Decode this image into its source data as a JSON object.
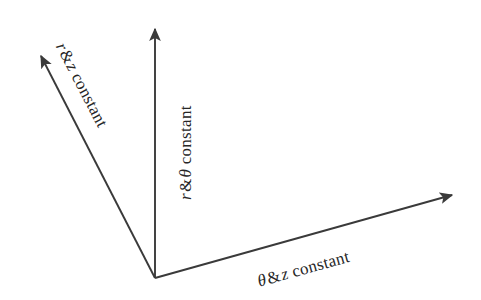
{
  "figure": {
    "type": "coordinate-axes-diagram",
    "background_color": "#ffffff",
    "stroke_color": "#3a3a3a",
    "text_color": "#262626"
  },
  "origin": {
    "x": 155,
    "y": 278
  },
  "axes": [
    {
      "id": "upper-left-axis",
      "label": {
        "full_text": "r & z constant",
        "symbol": "r",
        "amp": "&",
        "second": "z",
        "word": "constant"
      },
      "from": {
        "x": 155,
        "y": 278
      },
      "to": {
        "x": 38,
        "y": 52
      },
      "rotation_deg": 62.5,
      "arrowhead": "solid-triangle"
    },
    {
      "id": "vertical-axis",
      "label": {
        "full_text": "r & θ constant",
        "symbol": "r",
        "amp": "&",
        "second": "θ",
        "word": "constant"
      },
      "from": {
        "x": 155,
        "y": 278
      },
      "to": {
        "x": 155,
        "y": 24
      },
      "rotation_deg": -90,
      "arrowhead": "solid-triangle"
    },
    {
      "id": "lower-right-axis",
      "label": {
        "full_text": "θ & z constant",
        "symbol": "θ",
        "amp": "&",
        "second": "z",
        "word": "constant"
      },
      "from": {
        "x": 155,
        "y": 278
      },
      "to": {
        "x": 457,
        "y": 194
      },
      "rotation_deg": -15.5,
      "arrowhead": "solid-triangle"
    }
  ]
}
